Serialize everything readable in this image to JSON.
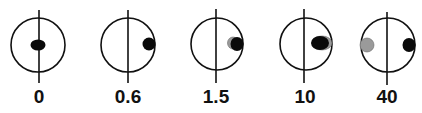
{
  "diagram": {
    "colors": {
      "stroke": "#111111",
      "black_dot": "#0a0a0a",
      "gray_dot": "#9a9a9a",
      "background": "#ffffff"
    },
    "panels": [
      {
        "label": "0",
        "circle": {
          "cx": 38,
          "cy": 45,
          "r": 27
        },
        "line": {
          "x": 39,
          "y1": 10,
          "y2": 83
        },
        "dots": [
          {
            "color": "black",
            "cx": 38,
            "cy": 45,
            "rx": 7.5,
            "ry": 5.5
          }
        ]
      },
      {
        "label": "0.6",
        "circle": {
          "cx": 128,
          "cy": 45,
          "r": 27
        },
        "line": {
          "x": 128,
          "y1": 10,
          "y2": 83
        },
        "dots": [
          {
            "color": "black",
            "cx": 149,
            "cy": 44,
            "rx": 6.5,
            "ry": 6.5
          }
        ]
      },
      {
        "label": "1.5",
        "circle": {
          "cx": 217,
          "cy": 44,
          "r": 26
        },
        "line": {
          "x": 216,
          "y1": 9,
          "y2": 83
        },
        "dots": [
          {
            "color": "gray",
            "cx": 233,
            "cy": 43,
            "rx": 5.5,
            "ry": 6
          },
          {
            "color": "black",
            "cx": 237,
            "cy": 44,
            "rx": 6.5,
            "ry": 7
          }
        ]
      },
      {
        "label": "10",
        "circle": {
          "cx": 306,
          "cy": 44,
          "r": 26
        },
        "line": {
          "x": 304,
          "y1": 9,
          "y2": 83
        },
        "dots": [
          {
            "color": "gray",
            "cx": 322,
            "cy": 43,
            "rx": 10,
            "ry": 7
          },
          {
            "color": "black",
            "cx": 320,
            "cy": 43,
            "rx": 9,
            "ry": 7
          }
        ]
      },
      {
        "label": "40",
        "circle": {
          "cx": 388,
          "cy": 45,
          "r": 27
        },
        "line": {
          "x": 387,
          "y1": 12,
          "y2": 85
        },
        "dots": [
          {
            "color": "gray",
            "cx": 367,
            "cy": 45,
            "rx": 7,
            "ry": 7
          },
          {
            "color": "black",
            "cx": 409,
            "cy": 45,
            "rx": 6.5,
            "ry": 7
          }
        ]
      }
    ]
  }
}
